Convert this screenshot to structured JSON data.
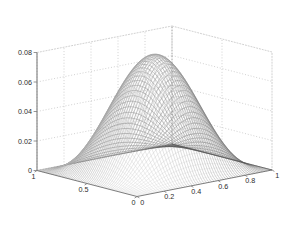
{
  "figure": {
    "kind": "matlab-3d-surface-plot",
    "background_color": "#ffffff",
    "axis_line_color": "#808080",
    "grid_color": "#aaaaaa",
    "grid_style": "dotted",
    "mesh_color_dark": "#4a4a4a",
    "mesh_color_light": "#efefef",
    "base_edge_color": "#555555"
  },
  "chart_data": {
    "type": "surface",
    "title": "",
    "xlabel": "",
    "ylabel": "",
    "zlabel": "",
    "xlim": [
      0,
      1
    ],
    "ylim": [
      0,
      1
    ],
    "zlim": [
      0,
      0.08
    ],
    "grid": true,
    "legend": false,
    "legend_position": "none",
    "colormap": "gray",
    "shading": "mesh",
    "view": {
      "azimuth": -37.5,
      "elevation": 30
    },
    "xticks": [
      0,
      0.2,
      0.4,
      0.6,
      0.8,
      1
    ],
    "xticklabels": [
      "0",
      "0.2",
      "0.4",
      "0.6",
      "0.8",
      "1"
    ],
    "yticks": [
      0,
      0.5,
      1
    ],
    "yticklabels": [
      "0",
      "0.5",
      "1"
    ],
    "zticks": [
      0,
      0.02,
      0.04,
      0.06,
      0.08
    ],
    "zticklabels": [
      "0",
      "0.02",
      "0.04",
      "0.06",
      "0.08"
    ],
    "surface": {
      "description": "Bell-shaped bump, zero on the boundary of the unit square, single interior maximum near the centre.",
      "formula": "z = 0.0785 * (sin(pi*x)*sin(pi*y))^1.55",
      "peak_value": 0.078,
      "peak_location": [
        0.5,
        0.5
      ],
      "boundary_value": 0,
      "grid_n": 56,
      "z_samples": {
        "x": [
          0,
          0.125,
          0.25,
          0.375,
          0.5,
          0.625,
          0.75,
          0.875,
          1
        ],
        "y": [
          0,
          0.125,
          0.25,
          0.375,
          0.5,
          0.625,
          0.75,
          0.875,
          1
        ],
        "z": [
          [
            0,
            0,
            0,
            0,
            0,
            0,
            0,
            0,
            0
          ],
          [
            0,
            0.0055,
            0.0128,
            0.0181,
            0.02,
            0.0181,
            0.0128,
            0.0055,
            0
          ],
          [
            0,
            0.0128,
            0.0298,
            0.042,
            0.0464,
            0.042,
            0.0298,
            0.0128,
            0
          ],
          [
            0,
            0.0181,
            0.042,
            0.0592,
            0.0654,
            0.0592,
            0.042,
            0.0181,
            0
          ],
          [
            0,
            0.02,
            0.0464,
            0.0654,
            0.0723,
            0.0654,
            0.0464,
            0.02,
            0
          ],
          [
            0,
            0.0181,
            0.042,
            0.0592,
            0.0654,
            0.0592,
            0.042,
            0.0181,
            0
          ],
          [
            0,
            0.0128,
            0.0298,
            0.042,
            0.0464,
            0.042,
            0.0298,
            0.0128,
            0
          ],
          [
            0,
            0.0055,
            0.0128,
            0.0181,
            0.02,
            0.0181,
            0.0128,
            0.0055,
            0
          ],
          [
            0,
            0,
            0,
            0,
            0,
            0,
            0,
            0,
            0
          ]
        ]
      }
    },
    "z_axis_labels": [
      "0.08",
      "0.06",
      "0.04",
      "0.02",
      "0"
    ],
    "y_axis_labels": [
      "1",
      "0.5",
      "0"
    ],
    "x_axis_labels": [
      "0",
      "0.2",
      "0.4",
      "0.6",
      "0.8",
      "1"
    ]
  }
}
